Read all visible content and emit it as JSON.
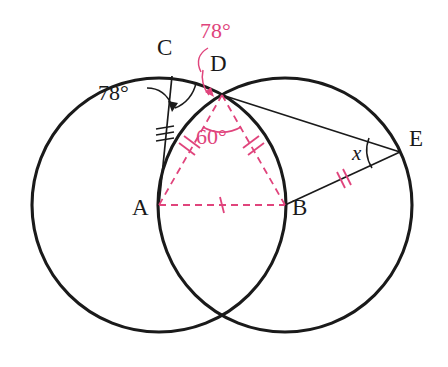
{
  "figure": {
    "type": "geometry-diagram",
    "colors": {
      "stroke": "#1a1a1a",
      "accent_pink": "#e0447c",
      "background": "#ffffff"
    },
    "points": {
      "A": {
        "label": "A",
        "x": 159,
        "y": 205,
        "label_x": 132,
        "label_y": 207
      },
      "B": {
        "label": "B",
        "x": 285,
        "y": 205,
        "label_x": 292,
        "label_y": 207
      },
      "C": {
        "label": "C",
        "x": 172,
        "y": 76,
        "label_x": 157,
        "label_y": 46
      },
      "D": {
        "label": "D",
        "x": 222,
        "y": 95,
        "label_x": 210,
        "label_y": 61
      },
      "E": {
        "label": "E",
        "x": 400,
        "y": 152,
        "label_x": 409,
        "label_y": 137
      }
    },
    "circles": [
      {
        "name": "circle-a",
        "center": "A",
        "cx": 159,
        "cy": 205,
        "r": 127
      },
      {
        "name": "circle-b",
        "center": "B",
        "cx": 285,
        "cy": 205,
        "r": 127
      }
    ],
    "solid_segments": [
      {
        "name": "segment-ca",
        "from": "C",
        "to": "A"
      },
      {
        "name": "segment-de",
        "from": "D",
        "to": "E"
      },
      {
        "name": "segment-be",
        "from": "B",
        "to": "E"
      }
    ],
    "dashed_segments": [
      {
        "name": "segment-ad",
        "from": "A",
        "to": "D",
        "ticks": 2
      },
      {
        "name": "segment-bd",
        "from": "B",
        "to": "D",
        "ticks": 2
      },
      {
        "name": "segment-ab",
        "from": "A",
        "to": "B",
        "ticks": 1
      }
    ],
    "tick_marks": [
      {
        "name": "tick-ca",
        "on": "segment-ca",
        "count": 3,
        "color": "#1a1a1a"
      },
      {
        "name": "tick-ad",
        "on": "segment-ad",
        "count": 2,
        "color": "#e0447c"
      },
      {
        "name": "tick-bd",
        "on": "segment-bd",
        "count": 2,
        "color": "#e0447c"
      },
      {
        "name": "tick-ab",
        "on": "segment-ab",
        "count": 1,
        "color": "#e0447c"
      },
      {
        "name": "tick-be",
        "on": "segment-be",
        "count": 2,
        "color": "#e0447c"
      }
    ],
    "angles": [
      {
        "name": "angle-at-c",
        "label": "78°",
        "value": 78,
        "unit": "degrees",
        "color": "#1a1a1a",
        "vertex": "C",
        "label_x": 103,
        "label_y": 92,
        "has_leader_arrow": true
      },
      {
        "name": "angle-at-d-cd",
        "label": "78°",
        "value": 78,
        "unit": "degrees",
        "color": "#e0447c",
        "vertex": "D",
        "label_x": 203,
        "label_y": 28,
        "has_leader_arrow": true
      },
      {
        "name": "angle-adb",
        "label": "60°",
        "value": 60,
        "unit": "degrees",
        "color": "#e0447c",
        "vertex": "D",
        "label_x": 198,
        "label_y": 124,
        "has_leader_arrow": false
      },
      {
        "name": "angle-x-at-e",
        "label": "x",
        "value": null,
        "unit": "unknown",
        "color": "#1a1a1a",
        "vertex": "E",
        "label_x": 352,
        "label_y": 143,
        "has_leader_arrow": false
      }
    ]
  }
}
